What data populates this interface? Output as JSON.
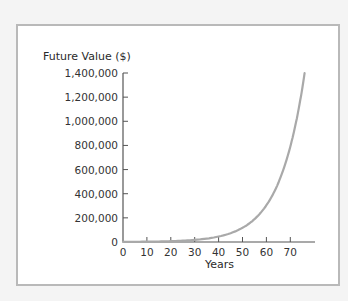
{
  "chart_data": {
    "type": "line",
    "title": "",
    "xlabel": "Years",
    "ylabel": "Future Value ($)",
    "xlim": [
      0,
      80
    ],
    "ylim": [
      0,
      1400000
    ],
    "x_ticks": [
      0,
      10,
      20,
      30,
      40,
      50,
      60,
      70
    ],
    "x_tick_labels": [
      "0",
      "10",
      "20",
      "30",
      "40",
      "50",
      "60",
      "70"
    ],
    "y_ticks": [
      0,
      200000,
      400000,
      600000,
      800000,
      1000000,
      1200000,
      1400000
    ],
    "y_tick_labels": [
      "0",
      "200,000",
      "400,000",
      "600,000",
      "800,000",
      "1,000,000",
      "1,200,000",
      "1,400,000"
    ],
    "grid": false,
    "legend": null,
    "series": [
      {
        "name": "Future Value",
        "color": "#a9a9a9",
        "x": [
          0,
          10,
          20,
          30,
          40,
          50,
          55,
          60,
          65,
          70,
          73,
          76
        ],
        "values": [
          1000,
          2594,
          6727,
          17449,
          45259,
          117391,
          189059,
          304482,
          490371,
          789747,
          1051153,
          1399084
        ]
      }
    ]
  },
  "labels": {
    "y_title": "Future Value ($)",
    "x_title": "Years"
  }
}
